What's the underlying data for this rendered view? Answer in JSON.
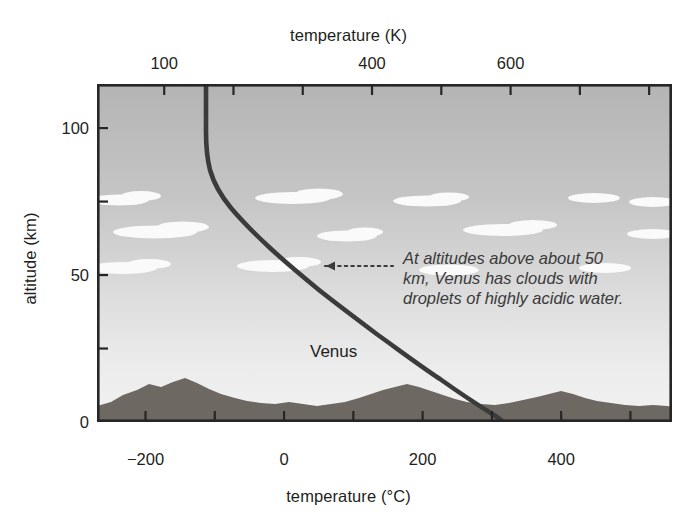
{
  "figure": {
    "top_axis": {
      "title": "temperature (K)",
      "ticks": [
        {
          "label": "100",
          "value": 100
        },
        {
          "label": "",
          "value": 200
        },
        {
          "label": "",
          "value": 300
        },
        {
          "label": "400",
          "value": 400
        },
        {
          "label": "",
          "value": 500
        },
        {
          "label": "600",
          "value": 600
        },
        {
          "label": "",
          "value": 700
        },
        {
          "label": "",
          "value": 800
        },
        {
          "label": "100",
          "value": 900
        }
      ]
    },
    "bottom_axis": {
      "title": "temperature (°C)",
      "ticks": [
        {
          "label": "−200",
          "value": -200
        },
        {
          "label": "",
          "value": -100
        },
        {
          "label": "0",
          "value": 0
        },
        {
          "label": "",
          "value": 100
        },
        {
          "label": "200",
          "value": 200
        },
        {
          "label": "",
          "value": 300
        },
        {
          "label": "400",
          "value": 400
        },
        {
          "label": "",
          "value": 500
        }
      ]
    },
    "left_axis": {
      "title": "altitude (km)",
      "ticks": [
        {
          "label": "0",
          "value": 0
        },
        {
          "label": "",
          "value": 25
        },
        {
          "label": "50",
          "value": 50
        },
        {
          "label": "",
          "value": 75
        },
        {
          "label": "100",
          "value": 100
        }
      ]
    },
    "curve_label": "Venus",
    "annotation": {
      "line1": "At altitudes above about 50",
      "line2": "km, Venus has clouds with",
      "line3": "droplets of highly acidic water."
    },
    "colors": {
      "curve": "#3c3c3c",
      "text": "#231f20",
      "sky_top": "#b9b9b9",
      "sky_bottom": "#efefef",
      "cloud": "#fbfbfb",
      "terrain": "#6e6a63",
      "frame": "#2a2a2a"
    }
  },
  "chart_data": {
    "type": "line",
    "title": "temperature (K)",
    "xlabel": "temperature (°C)",
    "ylabel": "altitude (km)",
    "xlim": [
      -270,
      560
    ],
    "ylim": [
      0,
      115
    ],
    "x_secondary_label": "temperature (K)",
    "x_secondary_lim": [
      3,
      833
    ],
    "grid": false,
    "legend": "none",
    "series": [
      {
        "name": "Venus",
        "x_unit": "°C",
        "y_unit": "km",
        "points": [
          {
            "temperature_c": -112,
            "altitude_km": 113
          },
          {
            "temperature_c": -112,
            "altitude_km": 105
          },
          {
            "temperature_c": -112,
            "altitude_km": 98
          },
          {
            "temperature_c": -111,
            "altitude_km": 92
          },
          {
            "temperature_c": -109,
            "altitude_km": 86
          },
          {
            "temperature_c": -105,
            "altitude_km": 80
          },
          {
            "temperature_c": -97,
            "altitude_km": 75
          },
          {
            "temperature_c": -84,
            "altitude_km": 70
          },
          {
            "temperature_c": -62,
            "altitude_km": 65
          },
          {
            "temperature_c": -34,
            "altitude_km": 60
          },
          {
            "temperature_c": 0,
            "altitude_km": 55
          },
          {
            "temperature_c": 38,
            "altitude_km": 50
          },
          {
            "temperature_c": 78,
            "altitude_km": 45
          },
          {
            "temperature_c": 120,
            "altitude_km": 40
          },
          {
            "temperature_c": 163,
            "altitude_km": 35
          },
          {
            "temperature_c": 208,
            "altitude_km": 30
          },
          {
            "temperature_c": 253,
            "altitude_km": 25
          },
          {
            "temperature_c": 298,
            "altitude_km": 20
          },
          {
            "temperature_c": 342,
            "altitude_km": 15
          },
          {
            "temperature_c": 385,
            "altitude_km": 10
          },
          {
            "temperature_c": 425,
            "altitude_km": 5
          },
          {
            "temperature_c": 460,
            "altitude_km": 0
          }
        ]
      }
    ],
    "annotations": [
      {
        "text": "At altitudes above about 50 km, Venus has clouds with droplets of highly acidic water.",
        "points_to": {
          "temperature_c": 55,
          "altitude_km": 50
        }
      },
      {
        "text": "Venus",
        "at": {
          "temperature_c": 120,
          "altitude_km": 30
        }
      }
    ]
  }
}
